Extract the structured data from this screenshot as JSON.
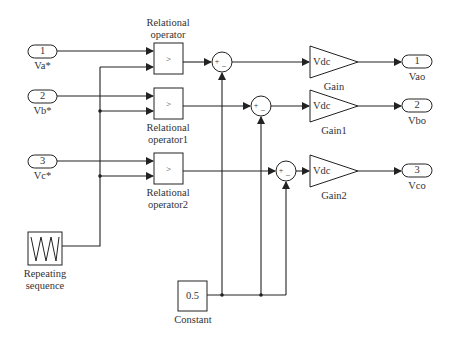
{
  "diagram": {
    "type": "simulink-block-diagram",
    "inports": [
      {
        "number": "1",
        "label": "Va*"
      },
      {
        "number": "2",
        "label": "Vb*"
      },
      {
        "number": "3",
        "label": "Vc*"
      }
    ],
    "relational_operators": [
      {
        "symbol": ">",
        "label_line1": "Relational",
        "label_line2": "operator"
      },
      {
        "symbol": ">",
        "label_line1": "Relational",
        "label_line2": "operator1"
      },
      {
        "symbol": ">",
        "label_line1": "Relational",
        "label_line2": "operator2"
      }
    ],
    "sums": [
      {
        "signs": "+ -"
      },
      {
        "signs": "+ -"
      },
      {
        "signs": "+ -"
      }
    ],
    "gains": [
      {
        "value": "Vdc",
        "label": "Gain"
      },
      {
        "value": "Vdc",
        "label": "Gain1"
      },
      {
        "value": "Vdc",
        "label": "Gain2"
      }
    ],
    "outports": [
      {
        "number": "1",
        "label": "Vao"
      },
      {
        "number": "2",
        "label": "Vbo"
      },
      {
        "number": "3",
        "label": "Vco"
      }
    ],
    "repeating_sequence": {
      "label_line1": "Repeating",
      "label_line2": "sequence"
    },
    "constant": {
      "value": "0.5",
      "label": "Constant"
    },
    "plus_sign": "+",
    "minus_sign": "_"
  }
}
